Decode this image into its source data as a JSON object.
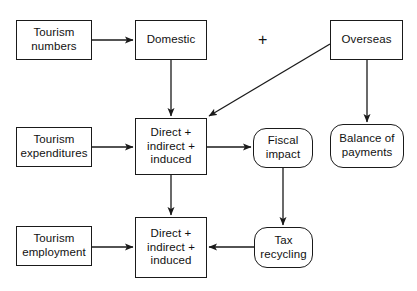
{
  "diagram": {
    "canvas": {
      "width": 417,
      "height": 291,
      "background": "#ffffff"
    },
    "style": {
      "stroke": "#1a1a1a",
      "text": "#111111",
      "fill": "#ffffff"
    },
    "operator": {
      "symbol": "+",
      "name": "plus-operator"
    },
    "nodes": [
      {
        "id": "tourism-numbers",
        "label": "Tourism\nnumbers",
        "shape": "rect",
        "x": 16,
        "y": 20,
        "w": 76,
        "h": 40
      },
      {
        "id": "domestic",
        "label": "Domestic",
        "shape": "rect",
        "x": 135,
        "y": 20,
        "w": 72,
        "h": 40
      },
      {
        "id": "overseas",
        "label": "Overseas",
        "shape": "rect",
        "x": 330,
        "y": 20,
        "w": 73,
        "h": 40
      },
      {
        "id": "tourism-expenditures",
        "label": "Tourism\nexpenditures",
        "shape": "rect",
        "x": 16,
        "y": 127,
        "w": 76,
        "h": 40
      },
      {
        "id": "direct-indirect-induced-expenditure",
        "label": "Direct +\nindirect +\ninduced",
        "shape": "rect",
        "x": 135,
        "y": 118,
        "w": 72,
        "h": 57
      },
      {
        "id": "fiscal-impact",
        "label": "Fiscal\nimpact",
        "shape": "rounded",
        "x": 253,
        "y": 128,
        "w": 60,
        "h": 40
      },
      {
        "id": "balance-of-payments",
        "label": "Balance of\npayments",
        "shape": "rounded",
        "x": 330,
        "y": 124,
        "w": 74,
        "h": 44
      },
      {
        "id": "tourism-employment",
        "label": "Tourism\nemployment",
        "shape": "rect",
        "x": 16,
        "y": 226,
        "w": 76,
        "h": 40
      },
      {
        "id": "direct-indirect-induced-employment",
        "label": "Direct +\nindirect +\ninduced",
        "shape": "rect",
        "x": 135,
        "y": 217,
        "w": 72,
        "h": 61
      },
      {
        "id": "tax-recycling",
        "label": "Tax\nrecycling",
        "shape": "rounded",
        "x": 254,
        "y": 227,
        "w": 59,
        "h": 41
      }
    ],
    "edges": [
      {
        "id": "tourism-numbers-to-domestic",
        "from": "tourism-numbers",
        "to": "domestic",
        "points": "92,40 133,40",
        "arrow": true
      },
      {
        "id": "domestic-to-expenditure-impact",
        "from": "domestic",
        "to": "direct-indirect-induced-expenditure",
        "points": "171,60 171,116",
        "arrow": true
      },
      {
        "id": "overseas-to-expenditure-impact",
        "from": "overseas",
        "to": "direct-indirect-induced-expenditure",
        "points": "330,44 209,116",
        "arrow": true
      },
      {
        "id": "overseas-to-balance-of-payments",
        "from": "overseas",
        "to": "balance-of-payments",
        "points": "367,60 367,122",
        "arrow": true
      },
      {
        "id": "tourism-expenditures-to-impact",
        "from": "tourism-expenditures",
        "to": "direct-indirect-induced-expenditure",
        "points": "92,147 133,147",
        "arrow": true
      },
      {
        "id": "expenditure-impact-to-fiscal-impact",
        "from": "direct-indirect-induced-expenditure",
        "to": "fiscal-impact",
        "points": "207,147 251,147",
        "arrow": true
      },
      {
        "id": "expenditure-impact-to-employment-impact",
        "from": "direct-indirect-induced-expenditure",
        "to": "direct-indirect-induced-employment",
        "points": "171,175 171,215",
        "arrow": true
      },
      {
        "id": "fiscal-impact-to-tax-recycling",
        "from": "fiscal-impact",
        "to": "tax-recycling",
        "points": "283,168 283,225",
        "arrow": true
      },
      {
        "id": "tourism-employment-to-impact",
        "from": "tourism-employment",
        "to": "direct-indirect-induced-employment",
        "points": "92,247 133,247",
        "arrow": true
      },
      {
        "id": "tax-recycling-to-employment-impact",
        "from": "tax-recycling",
        "to": "direct-indirect-induced-employment",
        "points": "254,247 209,247",
        "arrow": true
      }
    ]
  }
}
